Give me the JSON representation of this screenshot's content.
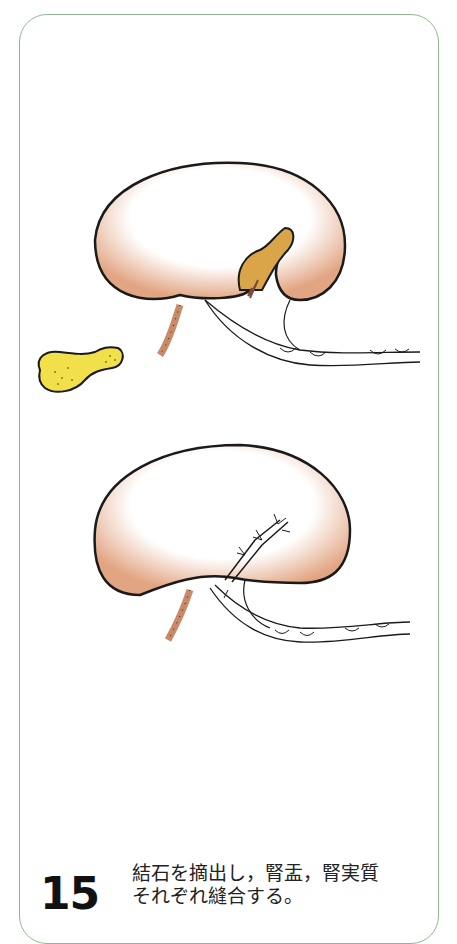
{
  "figure": {
    "step_number": "15",
    "caption_lines": [
      "結石を摘出し，腎盂，腎実質",
      "それぞれ縫合する。"
    ],
    "colors": {
      "frame": "#8fb88f",
      "kidney_shade": "#e2a583",
      "stone": "#f2e04a",
      "pelvis_incision": "#d9a548",
      "outline": "#1a1a1a"
    },
    "panels": [
      {
        "name": "kidney-with-open-pelvis",
        "description": "Kidney with incised renal pelvis; stone removed"
      },
      {
        "name": "kidney-sutured",
        "description": "Kidney with sutured pelvis and parenchyma"
      }
    ],
    "extracted_object": "renal-stone"
  }
}
